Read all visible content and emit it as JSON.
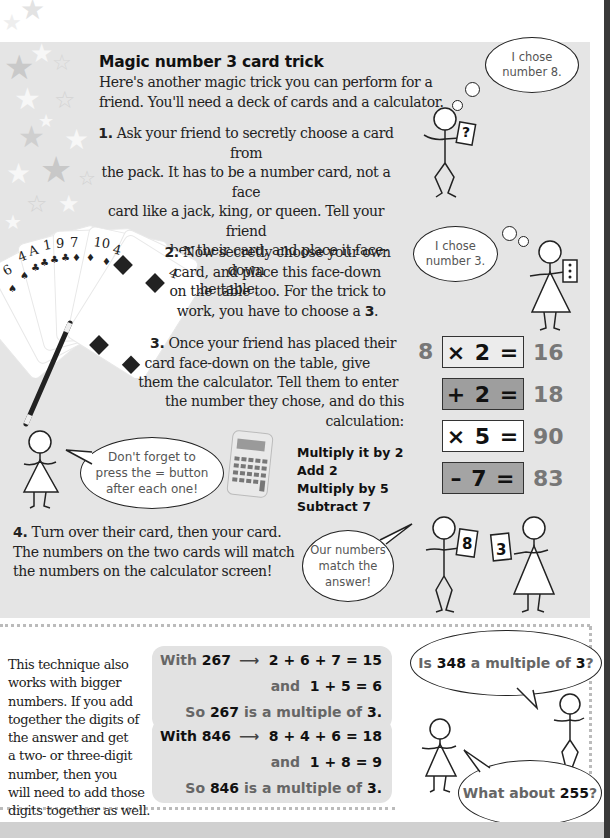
{
  "title": "Magic number 3 card trick",
  "intro": [
    "Here's another magic trick you can perform for a",
    "friend. You'll need a deck of cards and a calculator."
  ],
  "steps": [
    {
      "num": "1.",
      "lines": [
        "Ask your friend to secretly choose a card from",
        "the pack. It has to be a number card, not a face",
        "card like a jack, king, or queen. Tell your friend",
        "to remember their card, and place it face-down",
        "on the table."
      ]
    },
    {
      "num": "2.",
      "lines": [
        "Now secretly choose your own",
        "card, and place this face-down",
        "on the table too. For the trick to",
        "work, you have to choose a"
      ],
      "emph": "3",
      "end": "."
    },
    {
      "num": "3.",
      "lines": [
        "Once your friend has placed their",
        "card face-down on the table, give",
        "them the calculator. Tell them to enter",
        "the number they chose, and do this calculation:"
      ]
    },
    {
      "num": "4.",
      "lines": [
        "Turn over their card, then your card.",
        "The numbers on the two cards will match",
        "the numbers on the calculator screen!"
      ]
    }
  ],
  "thought_bubbles": {
    "friend": [
      "I chose",
      "number 8."
    ],
    "you": [
      "I chose",
      "number 3."
    ]
  },
  "friend_card": "?",
  "you_card": "⋮",
  "card_fan_labels": [
    "6",
    "4",
    "A",
    "1",
    "9",
    "7",
    "10",
    "4",
    "4"
  ],
  "reminder_bubble": [
    "Don't forget to",
    "press the = button",
    "after each one!"
  ],
  "instructions": [
    "Multiply it by 2",
    "Add 2",
    "Multiply by 5",
    "Subtract 7"
  ],
  "calculation": {
    "input": "8",
    "rows": [
      {
        "op": "× 2 =",
        "result": "16",
        "bg": "#ececec"
      },
      {
        "op": "+ 2 =",
        "result": "18",
        "bg": "#9e9e9e"
      },
      {
        "op": "× 5 =",
        "result": "90",
        "bg": "#ffffff"
      },
      {
        "op": "– 7 =",
        "result": "83",
        "bg": "#a4a4a4"
      }
    ]
  },
  "match_bubble": [
    "Our numbers",
    "match the",
    "answer!"
  ],
  "reveal_cards": [
    "8",
    "3"
  ],
  "lower": {
    "text": [
      "This technique also",
      "works with bigger",
      "numbers. If you add",
      "together the digits of",
      "the answer and get",
      "a two- or three-digit",
      "number, then you",
      "will need to add those",
      "digits together as well."
    ],
    "examples": [
      {
        "with": "With",
        "number": "267",
        "arrow": "⟶",
        "sum1": "2 + 6 + 7 = 15",
        "and": "and",
        "sum2": "1 + 5 = 6",
        "so": "So",
        "is_text": "is a multiple of",
        "three": "3."
      },
      {
        "with": "With",
        "number": "846",
        "arrow": "⟶",
        "sum1": "8 + 4 + 6 = 18",
        "and": "and",
        "sum2": "1 + 8 = 9",
        "so": "So",
        "is_text": "is a multiple of",
        "three": "3."
      }
    ],
    "question1": {
      "pre": "Is",
      "num": "348",
      "mid": "a multiple of",
      "three": "3",
      "end": "?"
    },
    "question2": {
      "pre": "What about",
      "num": "255",
      "end": "?"
    }
  }
}
